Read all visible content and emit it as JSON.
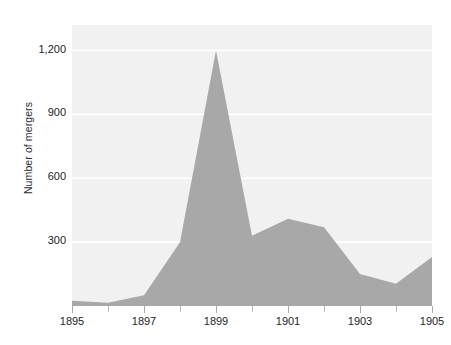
{
  "figure": {
    "name": "number-of-mergers-area-chart",
    "background_color": "#ffffff"
  },
  "chart_data": {
    "type": "area",
    "title": "",
    "subtitle": "",
    "xlabel": "",
    "ylabel": "Number of mergers",
    "x": [
      1895,
      1896,
      1897,
      1898,
      1899,
      1900,
      1901,
      1902,
      1903,
      1904,
      1905
    ],
    "values": [
      25,
      15,
      50,
      300,
      1200,
      330,
      410,
      370,
      150,
      105,
      230
    ],
    "series": [
      {
        "name": "Number of mergers",
        "values": [
          25,
          15,
          50,
          300,
          1200,
          330,
          410,
          370,
          150,
          105,
          230
        ]
      }
    ],
    "xlim": [
      1895,
      1905
    ],
    "ylim": [
      0,
      1320
    ],
    "yticks": [
      300,
      600,
      900,
      1200
    ],
    "ytick_labels": [
      "300",
      "600",
      "900",
      "1,200"
    ],
    "xticks": [
      1895,
      1896,
      1897,
      1898,
      1899,
      1900,
      1901,
      1902,
      1903,
      1904,
      1905
    ],
    "xtick_labels": [
      "1895",
      "",
      "1897",
      "",
      "1899",
      "",
      "1901",
      "",
      "1903",
      "",
      "1905"
    ],
    "xtick_labels_major": [
      "1895",
      "1897",
      "1899",
      "1901",
      "1903",
      "1905"
    ],
    "grid": true,
    "grid_axis": "y",
    "grid_color": "#ffffff",
    "legend": false,
    "legend_position": "none",
    "fill_color": "#a8a8a8",
    "plot_background_color": "#f1f1f1",
    "text_color": "#1d1d1d",
    "annotations": []
  }
}
